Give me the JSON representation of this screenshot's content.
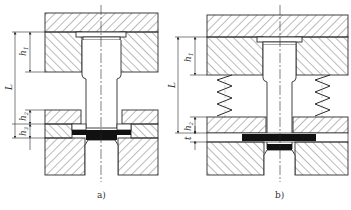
{
  "figure": {
    "panels": [
      {
        "id": "a",
        "caption": "a)",
        "dimensions": {
          "overall": "L",
          "upper": "h",
          "upper_sub": "1",
          "middle": "h",
          "middle_sub": "2",
          "lower": "h",
          "lower_sub": "3"
        },
        "has_springs": false
      },
      {
        "id": "b",
        "caption": "b)",
        "dimensions": {
          "overall": "L",
          "upper": "h",
          "upper_sub": "1",
          "middle": "h",
          "middle_sub": "2",
          "lower": "t"
        },
        "has_springs": true
      }
    ],
    "colors": {
      "line": "#2a2a2a",
      "hatch": "#555555",
      "fill_black": "#111111",
      "background": "#ffffff"
    }
  }
}
